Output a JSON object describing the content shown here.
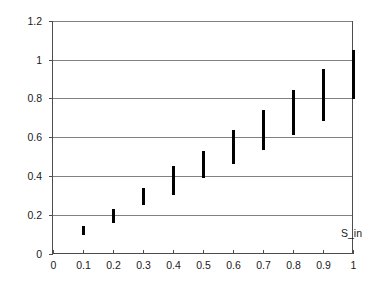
{
  "chart_data": {
    "type": "scatter",
    "subtype": "vertical-range-bars",
    "title": "",
    "xlabel": "",
    "ylabel": "Power (mW)",
    "series_annotation": "S_in",
    "xlim": [
      0,
      1
    ],
    "ylim": [
      0,
      1.2
    ],
    "grid": "horizontal",
    "legend": "none",
    "xticks": [
      0,
      0.1,
      0.2,
      0.3,
      0.4,
      0.5,
      0.6,
      0.7,
      0.8,
      0.9,
      1
    ],
    "xtick_labels": [
      "0",
      "0.1",
      "0.2",
      "0.3",
      "0.4",
      "0.5",
      "0.6",
      "0.7",
      "0.8",
      "0.9",
      "1"
    ],
    "yticks": [
      0,
      0.2,
      0.4,
      0.6,
      0.8,
      1,
      1.2
    ],
    "ytick_labels": [
      "0",
      "0.2",
      "0.4",
      "0.6",
      "0.8",
      "1",
      "1.2"
    ],
    "x": [
      0.1,
      0.2,
      0.3,
      0.4,
      0.5,
      0.6,
      0.7,
      0.8,
      0.9,
      1.0
    ],
    "low": [
      0.093,
      0.16,
      0.248,
      0.3,
      0.388,
      0.46,
      0.533,
      0.612,
      0.683,
      0.8
    ],
    "high": [
      0.14,
      0.232,
      0.336,
      0.45,
      0.528,
      0.636,
      0.74,
      0.842,
      0.952,
      1.048
    ],
    "mid": [
      0.117,
      0.196,
      0.292,
      0.375,
      0.458,
      0.548,
      0.637,
      0.727,
      0.818,
      0.924
    ],
    "colors": {
      "bar": "#000000",
      "grid": "#808080",
      "axis": "#4d4d4d",
      "text": "#1a1a1a",
      "background": "#ffffff"
    }
  },
  "axis": {
    "y_title": "Power (mW)",
    "series_annotation": "S_in"
  }
}
